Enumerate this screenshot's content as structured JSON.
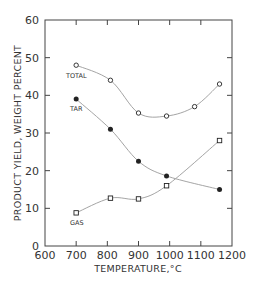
{
  "chart_data": {
    "type": "line",
    "title": "",
    "xlabel": "TEMPERATURE,°C",
    "ylabel": "PRODUCT YIELD, WEIGHT PERCENT",
    "xlim": [
      600,
      1200
    ],
    "ylim": [
      0,
      60
    ],
    "xticks": [
      600,
      700,
      800,
      900,
      1000,
      1100,
      1200
    ],
    "yticks": [
      0,
      10,
      20,
      30,
      40,
      50,
      60
    ],
    "grid": false,
    "legend": "inline labels",
    "series": [
      {
        "name": "TOTAL",
        "marker": "open-circle",
        "x": [
          700,
          810,
          900,
          990,
          1080,
          1160
        ],
        "y": [
          48,
          44,
          35.3,
          34.5,
          37,
          43
        ]
      },
      {
        "name": "TAR",
        "marker": "filled-circle",
        "x": [
          700,
          810,
          900,
          990,
          1160
        ],
        "y": [
          39,
          31,
          22.5,
          18.6,
          15
        ]
      },
      {
        "name": "GAS",
        "marker": "open-square",
        "x": [
          700,
          810,
          900,
          990,
          1160
        ],
        "y": [
          8.8,
          12.7,
          12.5,
          16,
          28
        ]
      }
    ]
  },
  "labels": {
    "total": "TOTAL",
    "tar": "TAR",
    "gas": "GAS",
    "xlabel": "TEMPERATURE,°C",
    "ylabel": "PRODUCT YIELD, WEIGHT PERCENT"
  },
  "colors": {
    "axis": "#444444",
    "curve": "#9a9a9a",
    "marker": "#222222",
    "text": "#333333"
  }
}
